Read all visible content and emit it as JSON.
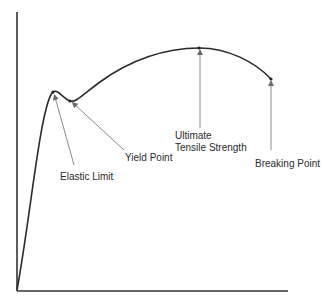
{
  "diagram": {
    "colors": {
      "axis": "#333333",
      "curve": "#2a2a2a",
      "pointer": "#8a8a8a",
      "text": "#2a2a2a"
    },
    "labels": {
      "elastic_limit": "Elastic Limit",
      "yield_point": "Yield Point",
      "uts_line1": "Ultimate",
      "uts_line2": "Tensile Strength",
      "breaking_point": "Breaking Point"
    }
  }
}
